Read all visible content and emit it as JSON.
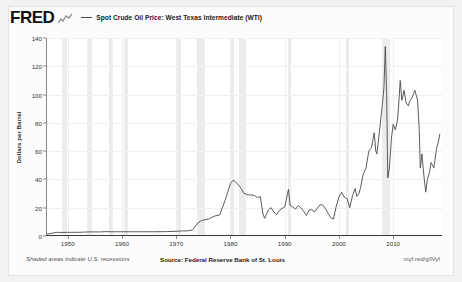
{
  "branding": {
    "logo_text": "FRED",
    "logo_icon": "fred-squiggle-icon"
  },
  "legend": {
    "entries": [
      {
        "label": "Spot Crude Oil Price: West Texas Intermediate (WTI)",
        "color": "#4a4a4a"
      }
    ]
  },
  "footer": {
    "recession_note": "Shaded areas indicate U.S. recessions",
    "source": "Source: Federal Reserve Bank of St. Louis",
    "permalink": "myf.red/g/lVyf"
  },
  "chart_data": {
    "type": "line",
    "title": "Spot Crude Oil Price: West Texas Intermediate (WTI)",
    "xlabel": "",
    "ylabel": "Dollars per Barrel",
    "ylim": [
      0,
      140
    ],
    "xlim": [
      1946,
      2019
    ],
    "grid": true,
    "legend_position": "top",
    "line_color": "#4a4a4a",
    "yticks": [
      0,
      20,
      40,
      60,
      80,
      100,
      120,
      140
    ],
    "ytick_labels": [
      "0",
      "20",
      "40",
      "60",
      "80",
      "100",
      "120",
      "140"
    ],
    "xticks": [
      1950,
      1960,
      1970,
      1980,
      1990,
      2000,
      2010
    ],
    "xtick_labels": [
      "1950",
      "1960",
      "1970",
      "1980",
      "1990",
      "2000",
      "2010"
    ],
    "recessions": [
      {
        "start": 1948.92,
        "end": 1949.83
      },
      {
        "start": 1953.58,
        "end": 1954.42
      },
      {
        "start": 1957.67,
        "end": 1958.33
      },
      {
        "start": 1960.33,
        "end": 1961.17
      },
      {
        "start": 1969.92,
        "end": 1970.92
      },
      {
        "start": 1973.92,
        "end": 1975.25
      },
      {
        "start": 1980.08,
        "end": 1980.58
      },
      {
        "start": 1981.58,
        "end": 1982.92
      },
      {
        "start": 1990.58,
        "end": 1991.25
      },
      {
        "start": 2001.25,
        "end": 2001.92
      },
      {
        "start": 2007.92,
        "end": 2009.5
      }
    ],
    "series": [
      {
        "name": "Spot Crude Oil Price: West Texas Intermediate (WTI)",
        "x": [
          1946.0,
          1947.0,
          1948.0,
          1949.0,
          1950.0,
          1952.0,
          1954.0,
          1956.0,
          1957.0,
          1958.0,
          1960.0,
          1962.0,
          1964.0,
          1966.0,
          1968.0,
          1970.0,
          1971.0,
          1972.0,
          1973.0,
          1974.0,
          1974.5,
          1975.0,
          1976.0,
          1977.0,
          1978.0,
          1979.0,
          1979.5,
          1980.0,
          1980.5,
          1981.0,
          1981.5,
          1982.0,
          1982.5,
          1983.0,
          1983.5,
          1984.0,
          1984.5,
          1985.0,
          1985.5,
          1986.0,
          1986.3,
          1986.6,
          1987.0,
          1987.5,
          1988.0,
          1988.5,
          1989.0,
          1989.5,
          1990.0,
          1990.7,
          1991.0,
          1991.5,
          1992.0,
          1992.5,
          1993.0,
          1993.5,
          1994.0,
          1994.5,
          1995.0,
          1995.5,
          1996.0,
          1996.5,
          1997.0,
          1997.5,
          1998.0,
          1998.5,
          1999.0,
          1999.5,
          2000.0,
          2000.5,
          2001.0,
          2001.5,
          2002.0,
          2002.5,
          2003.0,
          2003.3,
          2003.7,
          2004.0,
          2004.5,
          2005.0,
          2005.5,
          2006.0,
          2006.5,
          2006.8,
          2007.0,
          2007.5,
          2008.0,
          2008.3,
          2008.55,
          2008.8,
          2009.0,
          2009.3,
          2009.7,
          2010.0,
          2010.4,
          2010.8,
          2011.0,
          2011.3,
          2011.6,
          2012.0,
          2012.4,
          2012.8,
          2013.0,
          2013.5,
          2014.0,
          2014.5,
          2014.8,
          2015.0,
          2015.3,
          2015.6,
          2016.0,
          2016.3,
          2016.7,
          2017.0,
          2017.5,
          2018.0,
          2018.3,
          2018.6
        ],
        "y": [
          1.2,
          1.9,
          2.6,
          2.5,
          2.6,
          2.6,
          2.9,
          2.9,
          3.1,
          3.0,
          3.0,
          3.0,
          3.0,
          3.0,
          3.1,
          3.3,
          3.6,
          3.6,
          4.3,
          9.3,
          10.5,
          11.2,
          12.0,
          14.0,
          14.8,
          25.0,
          31.0,
          37.0,
          39.5,
          38.0,
          36.0,
          33.5,
          30.0,
          29.5,
          29.0,
          29.0,
          28.5,
          27.0,
          28.0,
          15.5,
          12.5,
          15.0,
          18.5,
          20.0,
          17.0,
          15.0,
          18.0,
          19.5,
          20.5,
          33.0,
          21.5,
          20.5,
          19.0,
          21.5,
          20.0,
          17.5,
          14.5,
          18.5,
          18.5,
          17.0,
          19.5,
          22.0,
          22.0,
          19.5,
          16.0,
          13.0,
          12.0,
          21.0,
          27.5,
          31.0,
          27.5,
          26.5,
          20.0,
          28.5,
          33.5,
          28.0,
          30.0,
          34.5,
          44.0,
          48.0,
          60.0,
          62.5,
          73.0,
          60.0,
          58.0,
          75.0,
          93.0,
          105.0,
          134.0,
          100.0,
          41.0,
          48.0,
          70.0,
          79.0,
          75.0,
          82.0,
          92.0,
          110.0,
          96.0,
          103.0,
          94.0,
          92.0,
          95.0,
          98.0,
          103.0,
          96.0,
          75.0,
          48.0,
          58.0,
          45.0,
          31.0,
          40.0,
          45.0,
          52.0,
          48.0,
          62.0,
          66.0,
          72.0
        ]
      }
    ]
  }
}
